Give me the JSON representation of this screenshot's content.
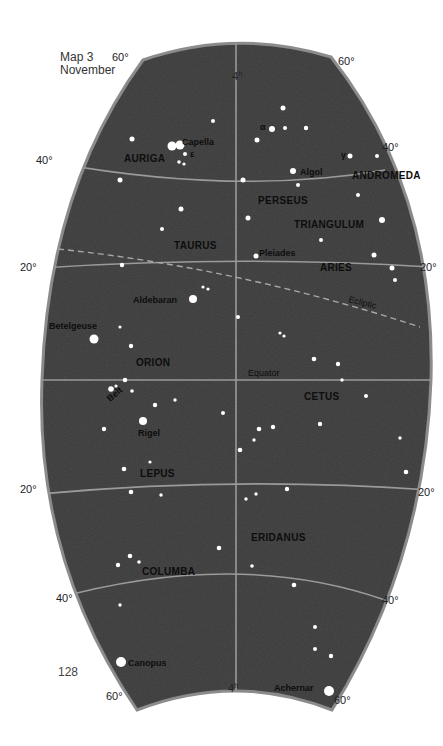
{
  "caption": {
    "line1": "Map 3",
    "line2": "November"
  },
  "page_number": "128",
  "colors": {
    "sky": "#3d3d3d",
    "rim": "#8a8a8a",
    "grid": "#9a9a9a",
    "star": "#ffffff",
    "text": "#0d0d0d"
  },
  "map_data": {
    "type": "star_chart",
    "title": "Map 3 November",
    "central_meridian": "4h",
    "declination_labels": [
      {
        "text": "60°",
        "x": 112,
        "y": 61
      },
      {
        "text": "60°",
        "x": 338,
        "y": 65
      },
      {
        "text": "40°",
        "x": 36,
        "y": 164
      },
      {
        "text": "40°",
        "x": 382,
        "y": 151
      },
      {
        "text": "20°",
        "x": 20,
        "y": 271
      },
      {
        "text": "20°",
        "x": 420,
        "y": 271
      },
      {
        "text": "20°",
        "x": 20,
        "y": 493
      },
      {
        "text": "20°",
        "x": 418,
        "y": 496
      },
      {
        "text": "40°",
        "x": 56,
        "y": 602
      },
      {
        "text": "40°",
        "x": 382,
        "y": 604
      },
      {
        "text": "60°",
        "x": 106,
        "y": 700
      },
      {
        "text": "60°",
        "x": 334,
        "y": 704
      }
    ],
    "hour_labels": [
      {
        "text": "4h",
        "x": 232,
        "y": 80
      },
      {
        "text": "4h",
        "x": 228,
        "y": 692
      }
    ],
    "line_labels": [
      {
        "text": "Equator",
        "x": 248,
        "y": 376,
        "rotate": 0
      },
      {
        "text": "Ecliptic",
        "x": 348,
        "y": 302,
        "rotate": 14
      }
    ],
    "constellations": [
      {
        "name": "AURIGA",
        "x": 124,
        "y": 162
      },
      {
        "name": "ANDROMEDA",
        "x": 352,
        "y": 179
      },
      {
        "name": "PERSEUS",
        "x": 258,
        "y": 204
      },
      {
        "name": "TRIANGULUM",
        "x": 294,
        "y": 228
      },
      {
        "name": "TAURUS",
        "x": 174,
        "y": 249
      },
      {
        "name": "ARIES",
        "x": 320,
        "y": 271
      },
      {
        "name": "ORION",
        "x": 136,
        "y": 366
      },
      {
        "name": "CETUS",
        "x": 304,
        "y": 400
      },
      {
        "name": "LEPUS",
        "x": 140,
        "y": 477
      },
      {
        "name": "ERIDANUS",
        "x": 251,
        "y": 541
      },
      {
        "name": "COLUMBA",
        "x": 142,
        "y": 575
      }
    ],
    "named_stars": [
      {
        "name": "Capella",
        "x": 180,
        "y": 145,
        "label_x": 182,
        "label_y": 145,
        "r": 4.5
      },
      {
        "name": "Algol",
        "x": 293,
        "y": 171,
        "label_x": 300,
        "label_y": 175,
        "r": 3
      },
      {
        "name": "Pleiades",
        "x": 256,
        "y": 256,
        "label_x": 259,
        "label_y": 256,
        "r": 2.5
      },
      {
        "name": "Aldebaran",
        "x": 193,
        "y": 299,
        "label_x": 133,
        "label_y": 303,
        "r": 4
      },
      {
        "name": "Betelgeuse",
        "x": 94,
        "y": 339,
        "label_x": 49,
        "label_y": 329,
        "r": 4.5
      },
      {
        "name": "Rigel",
        "x": 143,
        "y": 421,
        "label_x": 138,
        "label_y": 436,
        "r": 4
      },
      {
        "name": "Canopus",
        "x": 121,
        "y": 662,
        "label_x": 128,
        "label_y": 666,
        "r": 5
      },
      {
        "name": "Achernar",
        "x": 329,
        "y": 691,
        "label_x": 274,
        "label_y": 691,
        "r": 5
      }
    ],
    "greek_labels": [
      {
        "text": "ε",
        "x": 190,
        "y": 157
      },
      {
        "text": "α",
        "x": 260,
        "y": 130
      },
      {
        "text": "γ",
        "x": 341,
        "y": 158
      }
    ],
    "belt_label": {
      "text": "Belt",
      "x": 110,
      "y": 402
    },
    "stars": [
      [
        132,
        139,
        2.5
      ],
      [
        172,
        146,
        4.5
      ],
      [
        185,
        154,
        2
      ],
      [
        179,
        162,
        1.8
      ],
      [
        184,
        164,
        1.6
      ],
      [
        120,
        180,
        2.5
      ],
      [
        181,
        209,
        2.5
      ],
      [
        162,
        229,
        2
      ],
      [
        213,
        121,
        2
      ],
      [
        283,
        108,
        2.5
      ],
      [
        272,
        129,
        3
      ],
      [
        285,
        128,
        2
      ],
      [
        306,
        128,
        2.2
      ],
      [
        257,
        140,
        2.5
      ],
      [
        350,
        156,
        2.5
      ],
      [
        377,
        156,
        2
      ],
      [
        243,
        180,
        2.5
      ],
      [
        298,
        185,
        2
      ],
      [
        358,
        195,
        2
      ],
      [
        382,
        220,
        3
      ],
      [
        321,
        240,
        2
      ],
      [
        374,
        255,
        2.5
      ],
      [
        392,
        268,
        2.5
      ],
      [
        395,
        280,
        2
      ],
      [
        248,
        218,
        2.5
      ],
      [
        122,
        265,
        2.2
      ],
      [
        203,
        287,
        1.6
      ],
      [
        208,
        289,
        1.6
      ],
      [
        120,
        327,
        1.6
      ],
      [
        131,
        346,
        2.2
      ],
      [
        238,
        317,
        2
      ],
      [
        280,
        333,
        1.6
      ],
      [
        284,
        336,
        1.6
      ],
      [
        314,
        359,
        2.3
      ],
      [
        338,
        364,
        2.2
      ],
      [
        342,
        380,
        1.7
      ],
      [
        366,
        396,
        2
      ],
      [
        125,
        380,
        2.3
      ],
      [
        111,
        389,
        2.8
      ],
      [
        116,
        386,
        1.6
      ],
      [
        132,
        391,
        1.8
      ],
      [
        175,
        400,
        1.7
      ],
      [
        155,
        405,
        2.2
      ],
      [
        104,
        429,
        2.2
      ],
      [
        223,
        413,
        2
      ],
      [
        259,
        429,
        2.3
      ],
      [
        273,
        427,
        2.2
      ],
      [
        320,
        424,
        2.2
      ],
      [
        400,
        438,
        1.7
      ],
      [
        406,
        472,
        2.3
      ],
      [
        150,
        462,
        1.6
      ],
      [
        124,
        469,
        2.3
      ],
      [
        131,
        492,
        2.3
      ],
      [
        161,
        495,
        1.7
      ],
      [
        240,
        450,
        2.3
      ],
      [
        254,
        440,
        1.7
      ],
      [
        246,
        499,
        1.7
      ],
      [
        256,
        494,
        1.7
      ],
      [
        287,
        489,
        2.2
      ],
      [
        219,
        548,
        2.3
      ],
      [
        252,
        566,
        1.8
      ],
      [
        294,
        585,
        2.3
      ],
      [
        118,
        565,
        2.2
      ],
      [
        130,
        556,
        2.3
      ],
      [
        139,
        562,
        1.8
      ],
      [
        120,
        605,
        1.7
      ],
      [
        315,
        627,
        2
      ],
      [
        315,
        649,
        2
      ],
      [
        331,
        656,
        2.2
      ]
    ],
    "dark_patches": [],
    "ecliptic": "dashed line from (58,249) to (420,327)"
  }
}
